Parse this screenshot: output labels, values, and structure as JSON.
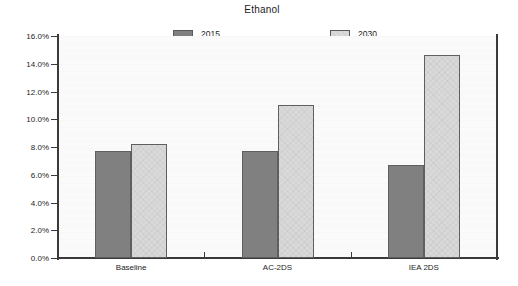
{
  "chart_data": {
    "type": "bar",
    "title": "Ethanol",
    "xlabel": "",
    "ylabel": "",
    "categories": [
      "Baseline",
      "AC-2DS",
      "IEA 2DS"
    ],
    "series": [
      {
        "name": "2015",
        "values": [
          7.7,
          7.7,
          6.7
        ],
        "color": "#808080"
      },
      {
        "name": "2030",
        "values": [
          8.2,
          11.0,
          14.6
        ],
        "color": "#d9d9d9"
      }
    ],
    "ylim": [
      0,
      16
    ],
    "ytick_values": [
      0,
      2,
      4,
      6,
      8,
      10,
      12,
      14,
      16
    ],
    "ytick_labels": [
      "0.0%",
      "2.0%",
      "4.0%",
      "6.0%",
      "8.0%",
      "10.0%",
      "12.0%",
      "14.0%",
      "16.0%"
    ],
    "grid": false,
    "legend_position": "top",
    "value_format": "percent"
  }
}
